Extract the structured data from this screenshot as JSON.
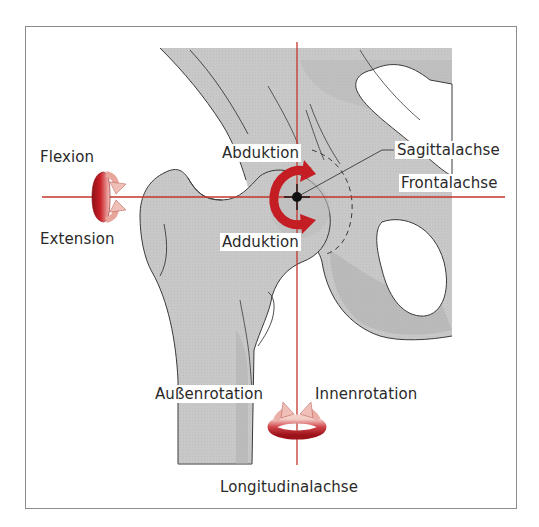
{
  "figure": {
    "colors": {
      "axis": "#c0392b",
      "arrow_dark": "#a8141b",
      "arrow_light": "#f1c4bd",
      "bone": "#c9c9c9",
      "bone_dark": "#a9a9a9",
      "outline": "#3a3a3a",
      "frame": "#8c8c8c",
      "text": "#2a2a2a"
    },
    "axes": {
      "sagittal": "Sagittalachse",
      "frontal": "Frontalachse",
      "longitudinal": "Longitudinalachse"
    },
    "movements": {
      "flexion": "Flexion",
      "extension": "Extension",
      "abduction": "Abduktion",
      "adduction": "Adduktion",
      "external_rotation": "Außenrotation",
      "internal_rotation": "Innenrotation"
    }
  }
}
